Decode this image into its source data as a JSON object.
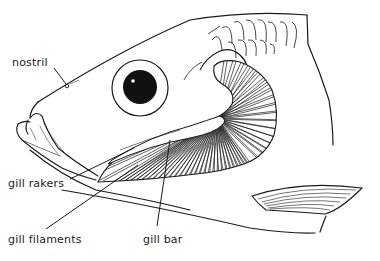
{
  "diagram": {
    "labels": {
      "nostril": "nostril",
      "gill_rakers": "gill rakers",
      "gill_filaments": "gill filaments",
      "gill_bar": "gill bar"
    },
    "colors": {
      "line": "#1a1a1a",
      "background": "#ffffff",
      "eye_pupil": "#111111"
    }
  }
}
